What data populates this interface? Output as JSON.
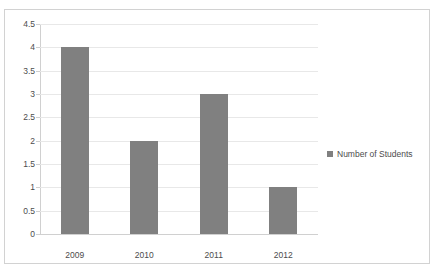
{
  "chart_data": {
    "type": "bar",
    "title": "",
    "xlabel": "",
    "ylabel": "",
    "categories": [
      "2009",
      "2010",
      "2011",
      "2012"
    ],
    "values": [
      4,
      2,
      3,
      1
    ],
    "series": [
      {
        "name": "Number of Students",
        "values": [
          4,
          2,
          3,
          1
        ],
        "color": "#808080"
      }
    ],
    "ylim": [
      0,
      4.5
    ],
    "ytick_step": 0.5,
    "yticks": [
      "0",
      "0.5",
      "1",
      "1.5",
      "2",
      "2.5",
      "3",
      "3.5",
      "4",
      "4.5"
    ],
    "grid": true,
    "grid_axis": "y",
    "legend": {
      "position": "right",
      "entries": [
        {
          "label": "Number of Students",
          "marker": "square",
          "color": "#808080"
        }
      ]
    },
    "colors": {
      "bar": "#808080",
      "gridline": "#e8e8e8",
      "axis": "#d0d0d0",
      "border": "#d2d2d2",
      "text": "#4c4c4c",
      "background": "#ffffff"
    }
  }
}
